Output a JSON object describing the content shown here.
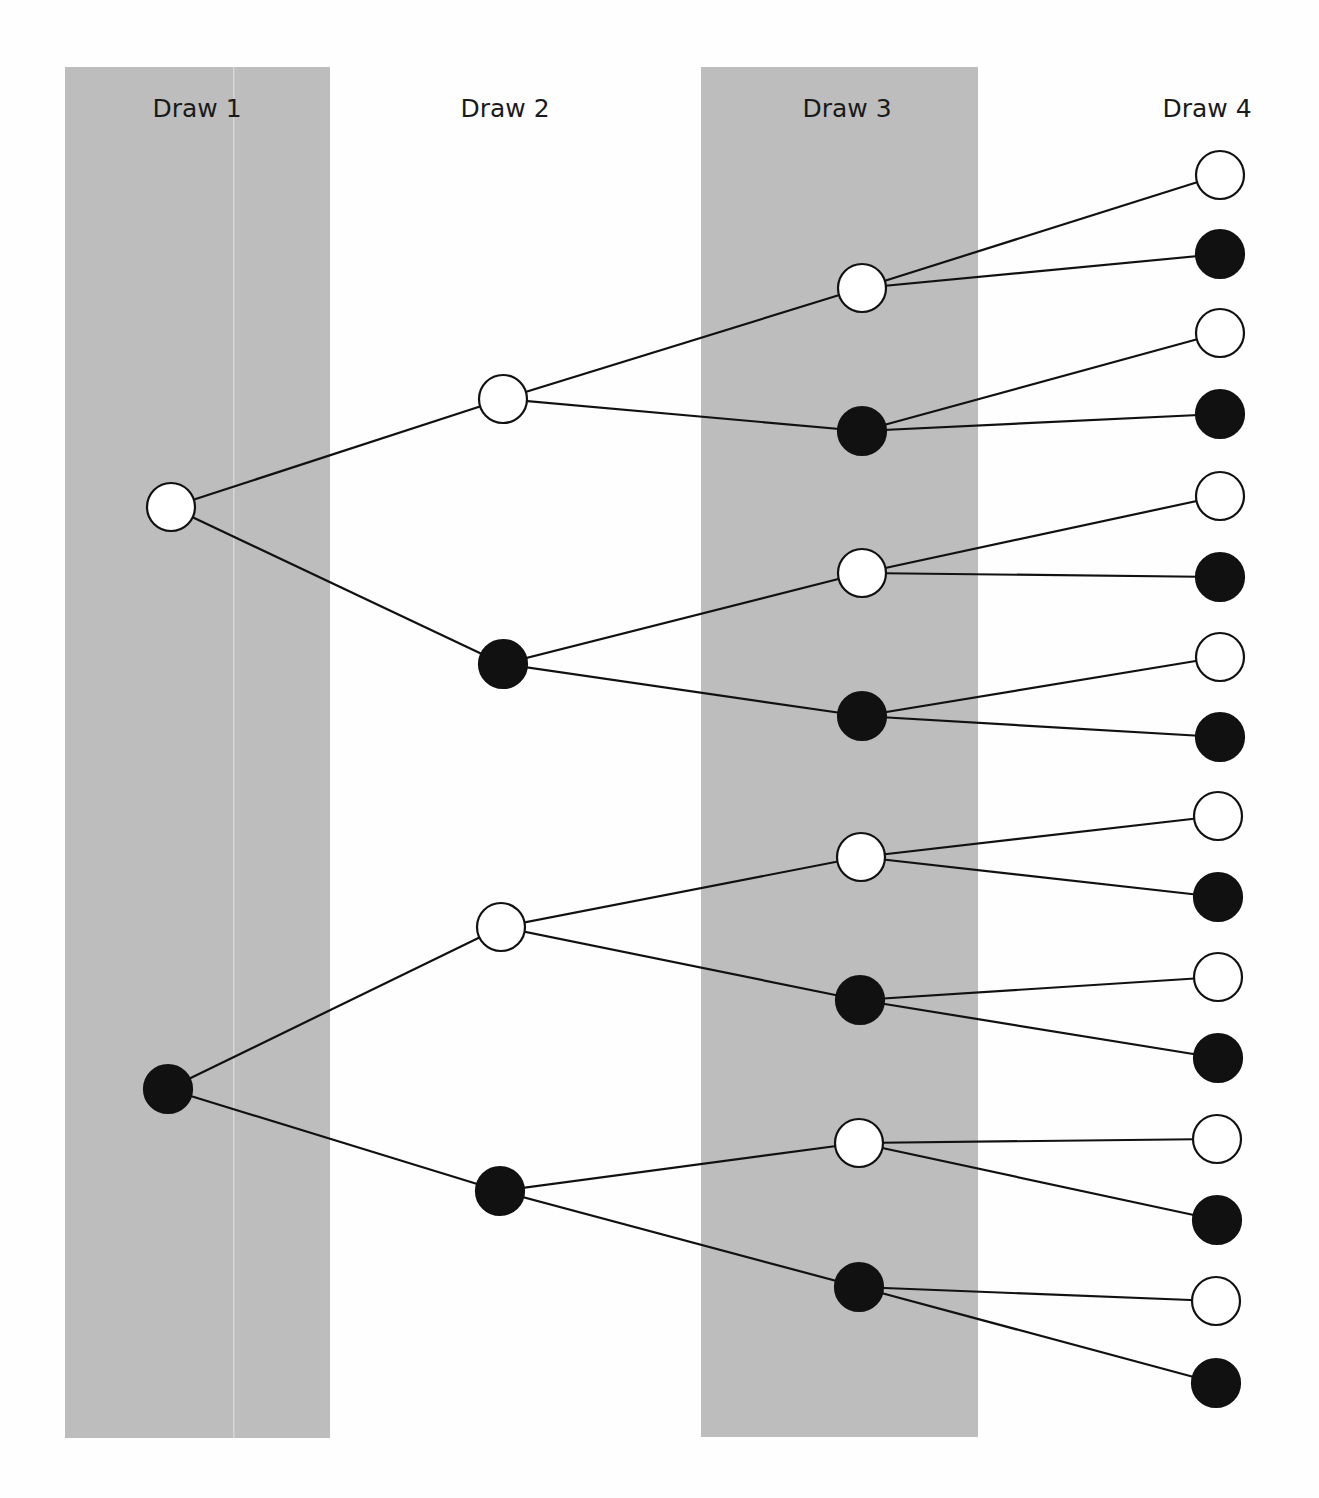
{
  "colors": {
    "panel": "#bdbdbd",
    "panel_seam": "#d6d6d6",
    "background": "#fefefe",
    "line": "#111111",
    "white_node": "#ffffff",
    "black_node": "#111111"
  },
  "columns": [
    {
      "label": "Draw 1",
      "x": 197,
      "shaded": true,
      "panel": {
        "x": 65,
        "y": 67,
        "w": 265,
        "h": 1371
      }
    },
    {
      "label": "Draw 2",
      "x": 505,
      "shaded": false
    },
    {
      "label": "Draw 3",
      "x": 847,
      "shaded": true,
      "panel": {
        "x": 701,
        "y": 67,
        "w": 277,
        "h": 1370
      }
    },
    {
      "label": "Draw 4",
      "x": 1207,
      "shaded": false
    }
  ],
  "node_radius": 24,
  "nodes": [
    {
      "id": "d1_w",
      "draw": 1,
      "color": "white",
      "x": 171,
      "y": 507
    },
    {
      "id": "d1_b",
      "draw": 1,
      "color": "black",
      "x": 168,
      "y": 1089
    },
    {
      "id": "d2_ww",
      "draw": 2,
      "color": "white",
      "x": 503,
      "y": 399,
      "parent": "d1_w"
    },
    {
      "id": "d2_wb",
      "draw": 2,
      "color": "black",
      "x": 503,
      "y": 664,
      "parent": "d1_w"
    },
    {
      "id": "d2_bw",
      "draw": 2,
      "color": "white",
      "x": 501,
      "y": 927,
      "parent": "d1_b"
    },
    {
      "id": "d2_bb",
      "draw": 2,
      "color": "black",
      "x": 500,
      "y": 1191,
      "parent": "d1_b"
    },
    {
      "id": "d3_www",
      "draw": 3,
      "color": "white",
      "x": 862,
      "y": 288,
      "parent": "d2_ww"
    },
    {
      "id": "d3_wwb",
      "draw": 3,
      "color": "black",
      "x": 862,
      "y": 431,
      "parent": "d2_ww"
    },
    {
      "id": "d3_wbw",
      "draw": 3,
      "color": "white",
      "x": 862,
      "y": 573,
      "parent": "d2_wb"
    },
    {
      "id": "d3_wbb",
      "draw": 3,
      "color": "black",
      "x": 862,
      "y": 716,
      "parent": "d2_wb"
    },
    {
      "id": "d3_bww",
      "draw": 3,
      "color": "white",
      "x": 861,
      "y": 857,
      "parent": "d2_bw"
    },
    {
      "id": "d3_bwb",
      "draw": 3,
      "color": "black",
      "x": 860,
      "y": 1000,
      "parent": "d2_bw"
    },
    {
      "id": "d3_bbw",
      "draw": 3,
      "color": "white",
      "x": 859,
      "y": 1143,
      "parent": "d2_bb"
    },
    {
      "id": "d3_bbb",
      "draw": 3,
      "color": "black",
      "x": 859,
      "y": 1287,
      "parent": "d2_bb"
    },
    {
      "id": "d4_1",
      "draw": 4,
      "color": "white",
      "x": 1220,
      "y": 175,
      "parent": "d3_www"
    },
    {
      "id": "d4_2",
      "draw": 4,
      "color": "black",
      "x": 1220,
      "y": 254,
      "parent": "d3_www"
    },
    {
      "id": "d4_3",
      "draw": 4,
      "color": "white",
      "x": 1220,
      "y": 333,
      "parent": "d3_wwb"
    },
    {
      "id": "d4_4",
      "draw": 4,
      "color": "black",
      "x": 1220,
      "y": 414,
      "parent": "d3_wwb"
    },
    {
      "id": "d4_5",
      "draw": 4,
      "color": "white",
      "x": 1220,
      "y": 496,
      "parent": "d3_wbw"
    },
    {
      "id": "d4_6",
      "draw": 4,
      "color": "black",
      "x": 1220,
      "y": 577,
      "parent": "d3_wbw"
    },
    {
      "id": "d4_7",
      "draw": 4,
      "color": "white",
      "x": 1220,
      "y": 657,
      "parent": "d3_wbb"
    },
    {
      "id": "d4_8",
      "draw": 4,
      "color": "black",
      "x": 1220,
      "y": 737,
      "parent": "d3_wbb"
    },
    {
      "id": "d4_9",
      "draw": 4,
      "color": "white",
      "x": 1218,
      "y": 816,
      "parent": "d3_bww"
    },
    {
      "id": "d4_10",
      "draw": 4,
      "color": "black",
      "x": 1218,
      "y": 897,
      "parent": "d3_bww"
    },
    {
      "id": "d4_11",
      "draw": 4,
      "color": "white",
      "x": 1218,
      "y": 977,
      "parent": "d3_bwb"
    },
    {
      "id": "d4_12",
      "draw": 4,
      "color": "black",
      "x": 1218,
      "y": 1058,
      "parent": "d3_bwb"
    },
    {
      "id": "d4_13",
      "draw": 4,
      "color": "white",
      "x": 1217,
      "y": 1139,
      "parent": "d3_bbw"
    },
    {
      "id": "d4_14",
      "draw": 4,
      "color": "black",
      "x": 1217,
      "y": 1220,
      "parent": "d3_bbw"
    },
    {
      "id": "d4_15",
      "draw": 4,
      "color": "white",
      "x": 1216,
      "y": 1301,
      "parent": "d3_bbb"
    },
    {
      "id": "d4_16",
      "draw": 4,
      "color": "black",
      "x": 1216,
      "y": 1383,
      "parent": "d3_bbb"
    }
  ]
}
